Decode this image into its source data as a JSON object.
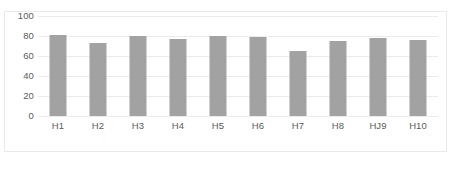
{
  "chart_data": {
    "type": "bar",
    "title": "",
    "xlabel": "",
    "ylabel": "",
    "categories": [
      "H1",
      "H2",
      "H3",
      "H4",
      "H5",
      "H6",
      "H7",
      "H8",
      "HJ9",
      "H10"
    ],
    "values": [
      81,
      73,
      80,
      77,
      80,
      79,
      65,
      75,
      78,
      76
    ],
    "ylim": [
      0,
      100
    ],
    "yticks": [
      0,
      20,
      40,
      60,
      80,
      100
    ],
    "ytick_labels": [
      "0",
      "20",
      "40",
      "60",
      "80",
      "100"
    ],
    "grid": "horizontal",
    "legend": "none",
    "series": [
      {
        "name": "",
        "values": [
          81,
          73,
          80,
          77,
          80,
          79,
          65,
          75,
          78,
          76
        ],
        "color": "#a2a2a2"
      }
    ]
  },
  "figure": {
    "caption": "",
    "border_color": "#e9e9e9",
    "gridline_color": "#ebebeb",
    "bar_color": "#a2a2a2",
    "text_color": "#5b5b5b",
    "background": "#ffffff"
  }
}
